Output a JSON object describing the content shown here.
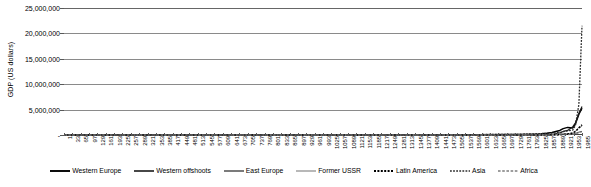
{
  "chart_data": {
    "type": "line",
    "title": "",
    "xlabel": "",
    "ylabel": "GDP (US dollars)",
    "ylim": [
      0,
      25000000
    ],
    "xlim": [
      1,
      1985
    ],
    "grid": true,
    "legend_position": "bottom",
    "y_ticks": [
      {
        "value": 25000000,
        "label": "25,000,000"
      },
      {
        "value": 20000000,
        "label": "20,000,000"
      },
      {
        "value": 15000000,
        "label": "15,000,000"
      },
      {
        "value": 10000000,
        "label": "10,000,000"
      },
      {
        "value": 5000000,
        "label": "5,000,000"
      },
      {
        "value": 0,
        "label": "-"
      }
    ],
    "x_ticks": [
      1,
      33,
      65,
      97,
      129,
      161,
      193,
      225,
      257,
      289,
      321,
      353,
      385,
      417,
      449,
      481,
      513,
      545,
      577,
      609,
      641,
      673,
      705,
      737,
      769,
      801,
      833,
      865,
      897,
      929,
      961,
      993,
      1025,
      1057,
      1089,
      1121,
      1153,
      1185,
      1217,
      1249,
      1281,
      1313,
      1345,
      1377,
      1409,
      1441,
      1473,
      1505,
      1537,
      1569,
      1601,
      1633,
      1665,
      1697,
      1729,
      1761,
      1793,
      1825,
      1857,
      1889,
      1921,
      1953,
      1985
    ],
    "x": [
      1,
      200,
      400,
      600,
      800,
      1000,
      1200,
      1400,
      1500,
      1600,
      1700,
      1750,
      1800,
      1820,
      1850,
      1870,
      1900,
      1913,
      1930,
      1950,
      1960,
      1973,
      1985
    ],
    "series": [
      {
        "name": "Western Europe",
        "style": "solid-thick",
        "color": "#000000",
        "values": [
          11000,
          11500,
          10500,
          11000,
          13000,
          14000,
          25000,
          30000,
          44000,
          66000,
          83000,
          110000,
          160000,
          188000,
          330000,
          480000,
          900000,
          1260000,
          1500000,
          1400000,
          2200000,
          4100000,
          5300000
        ]
      },
      {
        "name": "Western offshoots",
        "style": "solid-medium",
        "color": "#1a1a1a",
        "values": [
          500,
          600,
          700,
          700,
          800,
          800,
          900,
          1000,
          1100,
          1300,
          1800,
          3000,
          13000,
          18000,
          50000,
          98000,
          420000,
          700000,
          900000,
          1650000,
          2400000,
          4200000,
          5600000
        ]
      },
      {
        "name": "East Europe",
        "style": "solid-thin",
        "color": "#333333",
        "values": [
          1900,
          2000,
          1800,
          2000,
          2400,
          2600,
          3500,
          4500,
          6500,
          9000,
          12000,
          16000,
          24000,
          28000,
          45000,
          60000,
          110000,
          150000,
          190000,
          190000,
          320000,
          560000,
          720000
        ]
      },
      {
        "name": "Former USSR",
        "style": "solid-light",
        "color": "#9a9a9a",
        "values": [
          1600,
          1700,
          1500,
          1700,
          2000,
          2300,
          3000,
          4000,
          5500,
          8000,
          11000,
          15000,
          25000,
          32000,
          55000,
          85000,
          155000,
          230000,
          280000,
          330000,
          740000,
          1500000,
          1700000
        ]
      },
      {
        "name": "Latin America",
        "style": "dotted-thick",
        "color": "#000000",
        "values": [
          2200,
          2300,
          2200,
          2400,
          2800,
          3000,
          3400,
          3800,
          4100,
          4000,
          4200,
          5000,
          8000,
          10000,
          17000,
          26000,
          60000,
          110000,
          180000,
          420000,
          700000,
          1400000,
          2000000
        ]
      },
      {
        "name": "Asia",
        "style": "dotted-medium",
        "color": "#2b2b2b",
        "values": [
          16000,
          17000,
          15000,
          16500,
          20000,
          22000,
          35000,
          42000,
          62000,
          92000,
          120000,
          150000,
          230000,
          260000,
          320000,
          370000,
          480000,
          660000,
          800000,
          980000,
          1900000,
          6000000,
          21500000
        ]
      },
      {
        "name": "Africa",
        "style": "dashed-light",
        "color": "#7d7d7d",
        "values": [
          2000,
          2100,
          1900,
          2000,
          2300,
          2500,
          3000,
          3500,
          4000,
          4500,
          5000,
          6000,
          8000,
          9500,
          12000,
          16000,
          28000,
          45000,
          65000,
          110000,
          180000,
          420000,
          620000
        ]
      }
    ]
  }
}
